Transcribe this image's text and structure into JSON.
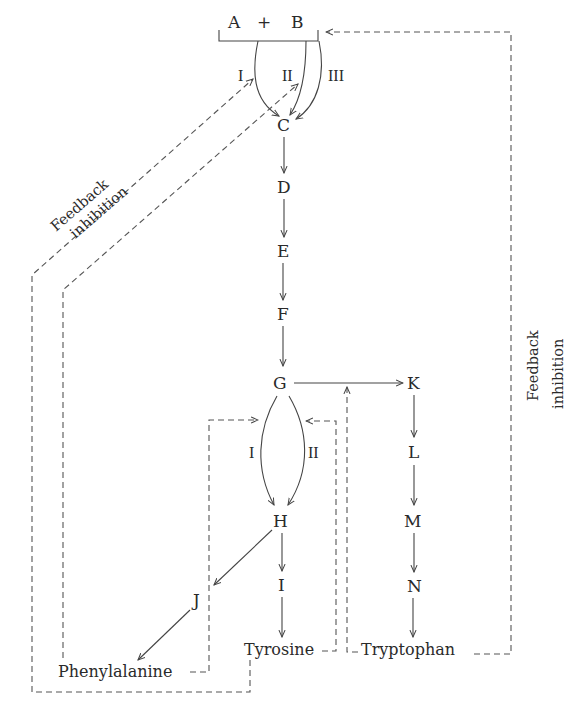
{
  "diagram": {
    "title": "",
    "colors": {
      "ink": "#2a2a2a",
      "line": "#444444",
      "background": "#ffffff"
    },
    "substrates": {
      "a": "A",
      "plus": "+",
      "b": "B"
    },
    "nodes": {
      "C": "C",
      "D": "D",
      "E": "E",
      "F": "F",
      "G": "G",
      "H": "H",
      "I": "I",
      "J": "J",
      "K": "K",
      "L": "L",
      "M": "M",
      "N": "N"
    },
    "products": {
      "phenylalanine": "Phenylalanine",
      "tyrosine": "Tyrosine",
      "tryptophan": "Tryptophan"
    },
    "enzymes": {
      "ab_to_c": [
        "I",
        "II",
        "III"
      ],
      "g_to_h": [
        "I",
        "II"
      ]
    },
    "labels": {
      "feedback_left_line1": "Feedback",
      "feedback_left_line2": "inhibition",
      "feedback_right_line1": "Feedback",
      "feedback_right_line2": "inhibition"
    },
    "edges": [
      {
        "from": "A+B",
        "to": "C",
        "enzyme": "I",
        "type": "reaction"
      },
      {
        "from": "A+B",
        "to": "C",
        "enzyme": "II",
        "type": "reaction"
      },
      {
        "from": "A+B",
        "to": "C",
        "enzyme": "III",
        "type": "reaction"
      },
      {
        "from": "C",
        "to": "D",
        "type": "reaction"
      },
      {
        "from": "D",
        "to": "E",
        "type": "reaction"
      },
      {
        "from": "E",
        "to": "F",
        "type": "reaction"
      },
      {
        "from": "F",
        "to": "G",
        "type": "reaction"
      },
      {
        "from": "G",
        "to": "H",
        "enzyme": "I",
        "type": "reaction"
      },
      {
        "from": "G",
        "to": "H",
        "enzyme": "II",
        "type": "reaction"
      },
      {
        "from": "G",
        "to": "K",
        "type": "reaction"
      },
      {
        "from": "H",
        "to": "J",
        "type": "reaction"
      },
      {
        "from": "H",
        "to": "I",
        "type": "reaction"
      },
      {
        "from": "J",
        "to": "Phenylalanine",
        "type": "reaction"
      },
      {
        "from": "I",
        "to": "Tyrosine",
        "type": "reaction"
      },
      {
        "from": "K",
        "to": "L",
        "type": "reaction"
      },
      {
        "from": "L",
        "to": "M",
        "type": "reaction"
      },
      {
        "from": "M",
        "to": "N",
        "type": "reaction"
      },
      {
        "from": "N",
        "to": "Tryptophan",
        "type": "reaction"
      },
      {
        "from": "Tyrosine",
        "to": "enzyme I (A+B→C)",
        "type": "feedback-inhibition"
      },
      {
        "from": "Phenylalanine",
        "to": "enzyme II (A+B→C)",
        "type": "feedback-inhibition"
      },
      {
        "from": "Tryptophan",
        "to": "enzyme III (A+B→C)",
        "type": "feedback-inhibition"
      },
      {
        "from": "Phenylalanine",
        "to": "enzyme I (G→H)",
        "type": "feedback-inhibition"
      },
      {
        "from": "Tyrosine",
        "to": "enzyme II (G→H)",
        "type": "feedback-inhibition"
      },
      {
        "from": "Tryptophan",
        "to": "G→K step",
        "type": "feedback-inhibition"
      }
    ]
  }
}
